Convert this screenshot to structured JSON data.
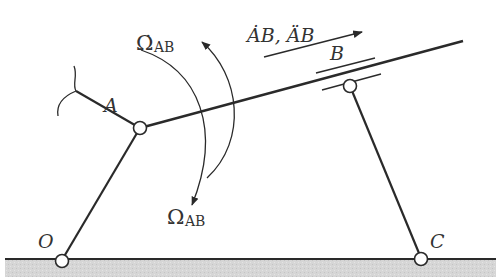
{
  "diagram": {
    "type": "linkage-mechanism",
    "labels": {
      "A": "A",
      "B": "B",
      "O": "O",
      "C": "C",
      "omega_dot": "Ω̇",
      "omega": "Ω",
      "omega_sub": "AB",
      "velocity_accel": "ȦB, ÄB"
    },
    "colors": {
      "line": "#2a2a2a",
      "ground": "#d4d4d4",
      "text": "#333333"
    },
    "joints": [
      {
        "name": "O",
        "x": 62,
        "y": 260
      },
      {
        "name": "A",
        "x": 140,
        "y": 128
      },
      {
        "name": "C",
        "x": 421,
        "y": 258
      },
      {
        "name": "B",
        "x": 350,
        "y": 86
      }
    ]
  }
}
